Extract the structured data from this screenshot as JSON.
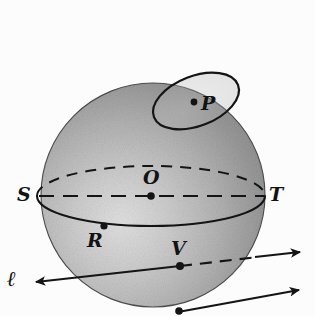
{
  "figure": {
    "background_color": "#fcfcfc",
    "stroke_color": "#141414",
    "sphere": {
      "name": "sphere",
      "center": {
        "x": 153,
        "y": 195
      },
      "radius": 112,
      "fill_light": "#cfcfcf",
      "fill_dark": "#8d8d8d",
      "highlight": {
        "x": 122,
        "y": 215
      }
    },
    "equator": {
      "name": "equator-ellipse",
      "center": {
        "x": 151,
        "y": 196
      },
      "rx": 114,
      "ry": 30,
      "back_style": "dashed",
      "front_style": "solid"
    },
    "diameter": {
      "name": "diameter-ST",
      "from": {
        "x": 39,
        "y": 196
      },
      "to": {
        "x": 264,
        "y": 196
      },
      "style": "dashed"
    },
    "small_circle": {
      "name": "circle-through-P",
      "center": {
        "x": 196,
        "y": 101
      },
      "rx": 45,
      "ry": 25,
      "rotation": -21,
      "style": "solid"
    },
    "line_l": {
      "name": "line-l",
      "from": {
        "x": 36,
        "y": 282
      },
      "to": {
        "x": 300,
        "y": 252
      },
      "arrowheads": "both",
      "inside_style": "dashed-right-of-V",
      "passes_through": "V"
    },
    "line_second": {
      "name": "tangent-line-lower",
      "from": {
        "x": 178,
        "y": 312
      },
      "to": {
        "x": 299,
        "y": 290
      },
      "arrowheads": "end",
      "style": "solid"
    },
    "points": [
      {
        "id": "P",
        "label": "P",
        "name": "point-P",
        "dot": {
          "x": 194,
          "y": 102
        },
        "label_pos": {
          "x": 201,
          "y": 96
        }
      },
      {
        "id": "O",
        "label": "O",
        "name": "point-O",
        "dot": {
          "x": 151,
          "y": 196
        },
        "label_pos": {
          "x": 144,
          "y": 169
        }
      },
      {
        "id": "S",
        "label": "S",
        "name": "point-S",
        "dot": null,
        "label_pos": {
          "x": 18,
          "y": 186
        }
      },
      {
        "id": "T",
        "label": "T",
        "name": "point-T",
        "dot": null,
        "label_pos": {
          "x": 269,
          "y": 186
        }
      },
      {
        "id": "R",
        "label": "R",
        "name": "point-R",
        "dot": {
          "x": 104,
          "y": 226
        },
        "label_pos": {
          "x": 88,
          "y": 232
        }
      },
      {
        "id": "V",
        "label": "V",
        "name": "point-V",
        "dot": {
          "x": 180,
          "y": 266
        },
        "label_pos": {
          "x": 172,
          "y": 240
        }
      },
      {
        "id": "W",
        "label": "",
        "name": "point-lower-tangent",
        "dot": {
          "x": 179,
          "y": 311
        },
        "label_pos": null
      }
    ],
    "line_labels": [
      {
        "id": "l",
        "label": "ℓ",
        "name": "label-line-l",
        "label_pos": {
          "x": 8,
          "y": 271
        }
      }
    ]
  }
}
